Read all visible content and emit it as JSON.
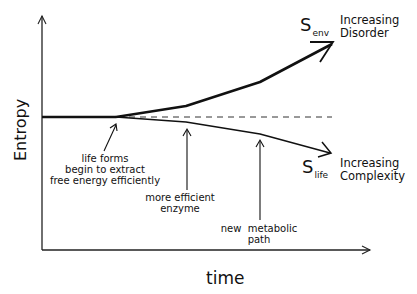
{
  "diagram": {
    "axes": {
      "y_label": "Entropy",
      "x_label": "time"
    },
    "curves": {
      "env": {
        "symbol": "S",
        "subscript": "env",
        "label_line1": "Increasing",
        "label_line2": "Disorder"
      },
      "life": {
        "symbol": "S",
        "subscript": "life",
        "label_line1": "Increasing",
        "label_line2": "Complexity"
      }
    },
    "annotations": [
      {
        "line1": "life forms",
        "line2": "begin to extract",
        "line3": "free energy efficiently"
      },
      {
        "line1": "more efficient",
        "line2": "enzyme"
      },
      {
        "line1": "new  metabolic",
        "line2": "path"
      }
    ],
    "colors": {
      "ink": "#111111",
      "background": "#ffffff"
    }
  }
}
